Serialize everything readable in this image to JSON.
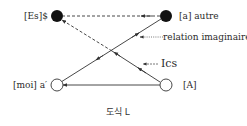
{
  "diagram": {
    "nodes": {
      "es": {
        "label": "[Es]$",
        "type": "filled"
      },
      "a": {
        "label": "[a] autre",
        "type": "filled"
      },
      "moi": {
        "label": "[moi] a′",
        "type": "open"
      },
      "A": {
        "label": "[A]",
        "type": "open"
      }
    },
    "annotations": {
      "relation": "relation imaginaire",
      "ics": "Ics"
    },
    "caption": "도식 L",
    "edges": [
      {
        "from": "a",
        "to": "es",
        "style": "dashed"
      },
      {
        "from": "A",
        "to": "es",
        "style": "solid-then-dashed"
      },
      {
        "from": "moi",
        "to": "a",
        "style": "solid"
      },
      {
        "from": "A",
        "to": "moi",
        "style": "solid"
      }
    ],
    "colors": {
      "line": "#333333",
      "node_fill": "#111111",
      "background": "#ffffff"
    }
  }
}
